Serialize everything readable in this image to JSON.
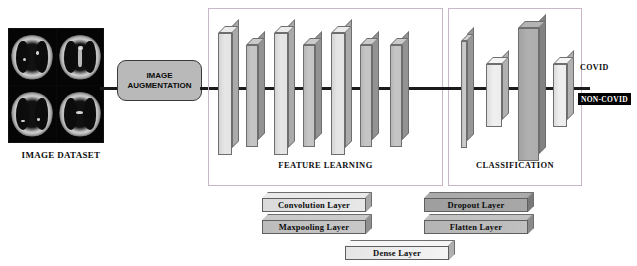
{
  "diagram": {
    "dataset": {
      "label": "IMAGE DATASET",
      "modality": "chest CT scan grid",
      "tiles": 4
    },
    "augmentation": {
      "line1": "IMAGE",
      "line2": "AUGMENTATION"
    },
    "sections": [
      {
        "id": "feature-learning",
        "label": "FEATURE LEARNING"
      },
      {
        "id": "classification",
        "label": "CLASSIFICATION"
      }
    ],
    "feature_layers": [
      {
        "name": "conv-1",
        "type": "Convolution Layer",
        "x": 218,
        "w": 14,
        "h": 122,
        "top": 26,
        "color": "#e6e6e6"
      },
      {
        "name": "pool-1",
        "type": "Maxpooling Layer",
        "x": 246,
        "w": 12,
        "h": 102,
        "top": 38,
        "color": "#c6c6c6"
      },
      {
        "name": "conv-2",
        "type": "Convolution Layer",
        "x": 274,
        "w": 14,
        "h": 122,
        "top": 26,
        "color": "#e6e6e6"
      },
      {
        "name": "pool-2",
        "type": "Maxpooling Layer",
        "x": 303,
        "w": 12,
        "h": 102,
        "top": 38,
        "color": "#c6c6c6"
      },
      {
        "name": "conv-3",
        "type": "Convolution Layer",
        "x": 331,
        "w": 14,
        "h": 122,
        "top": 26,
        "color": "#e6e6e6"
      },
      {
        "name": "pool-3",
        "type": "Maxpooling Layer",
        "x": 360,
        "w": 12,
        "h": 102,
        "top": 38,
        "color": "#c6c6c6"
      },
      {
        "name": "pool-4",
        "type": "Maxpooling Layer",
        "x": 390,
        "w": 12,
        "h": 102,
        "top": 38,
        "color": "#c6c6c6"
      }
    ],
    "classification_layers": [
      {
        "name": "flatten-1",
        "type": "Flatten Layer",
        "x": 461,
        "w": 6,
        "h": 107,
        "top": 34,
        "color": "#cccccc"
      },
      {
        "name": "dense-1",
        "type": "Dense Layer",
        "x": 486,
        "w": 16,
        "h": 63,
        "top": 57,
        "color": "#efefef"
      },
      {
        "name": "dropout-1",
        "type": "Dropout Layer",
        "x": 518,
        "w": 21,
        "h": 133,
        "top": 21,
        "color": "#b0b0b0"
      },
      {
        "name": "dense-2",
        "type": "Dense Layer",
        "x": 553,
        "w": 14,
        "h": 63,
        "top": 57,
        "color": "#efefef"
      }
    ],
    "outputs": [
      {
        "label": "COVID",
        "style": "plain"
      },
      {
        "label": "NON-COVID",
        "style": "inverted"
      }
    ],
    "legend": [
      {
        "label": "Convolution Layer",
        "color": "#e8e8e8",
        "x": 262,
        "y": 192,
        "w": 104
      },
      {
        "label": "Maxpooling Layer",
        "color": "#c8c8c8",
        "x": 262,
        "y": 214,
        "w": 104
      },
      {
        "label": "Dense Layer",
        "color": "#f4f4f4",
        "x": 345,
        "y": 240,
        "w": 104
      },
      {
        "label": "Dropout Layer",
        "color": "#a8a8a8",
        "x": 424,
        "y": 192,
        "w": 104
      },
      {
        "label": "Flatten Layer",
        "color": "#c0c0c0",
        "x": 424,
        "y": 214,
        "w": 104
      }
    ],
    "colors": {
      "bus": "#1b1b1b",
      "panel_border": "#c9b7c9",
      "augmentation_fill": "#b9b9b9",
      "slab_outline": "#6e6e6e",
      "background": "#ffffff"
    }
  }
}
